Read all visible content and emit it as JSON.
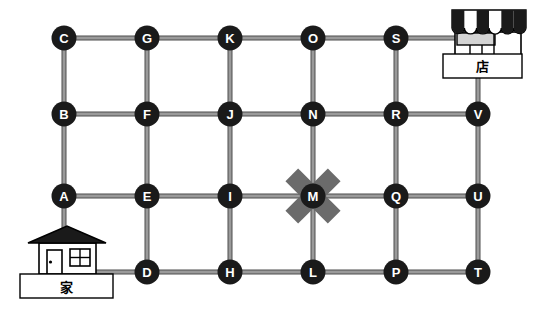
{
  "map": {
    "title": "Grid street map with home, shop and blocked intersection",
    "colors": {
      "node_fill": "#1a1a1a",
      "node_label": "#ffffff",
      "road": "#8c8c8c",
      "road_outline": "#4d4d4d",
      "blocked_mark": "#6b6b6b",
      "background": "#ffffff",
      "icon_stroke": "#000000"
    },
    "nodes": [
      {
        "id": "C",
        "label": "C",
        "x": 64,
        "y": 38,
        "row": 1,
        "col": 1
      },
      {
        "id": "G",
        "label": "G",
        "x": 147,
        "y": 38,
        "row": 1,
        "col": 2
      },
      {
        "id": "K",
        "label": "K",
        "x": 230,
        "y": 38,
        "row": 1,
        "col": 3
      },
      {
        "id": "O",
        "label": "O",
        "x": 313,
        "y": 38,
        "row": 1,
        "col": 4
      },
      {
        "id": "S",
        "label": "S",
        "x": 396,
        "y": 38,
        "row": 1,
        "col": 5
      },
      {
        "id": "B",
        "label": "B",
        "x": 64,
        "y": 114,
        "row": 2,
        "col": 1
      },
      {
        "id": "F",
        "label": "F",
        "x": 147,
        "y": 114,
        "row": 2,
        "col": 2
      },
      {
        "id": "J",
        "label": "J",
        "x": 230,
        "y": 114,
        "row": 2,
        "col": 3
      },
      {
        "id": "N",
        "label": "N",
        "x": 313,
        "y": 114,
        "row": 2,
        "col": 4
      },
      {
        "id": "R",
        "label": "R",
        "x": 396,
        "y": 114,
        "row": 2,
        "col": 5
      },
      {
        "id": "V",
        "label": "V",
        "x": 478,
        "y": 114,
        "row": 2,
        "col": 6
      },
      {
        "id": "A",
        "label": "A",
        "x": 64,
        "y": 196,
        "row": 3,
        "col": 1
      },
      {
        "id": "E",
        "label": "E",
        "x": 147,
        "y": 196,
        "row": 3,
        "col": 2
      },
      {
        "id": "I",
        "label": "I",
        "x": 230,
        "y": 196,
        "row": 3,
        "col": 3
      },
      {
        "id": "M",
        "label": "M",
        "x": 313,
        "y": 196,
        "row": 3,
        "col": 4
      },
      {
        "id": "Q",
        "label": "Q",
        "x": 396,
        "y": 196,
        "row": 3,
        "col": 5
      },
      {
        "id": "U",
        "label": "U",
        "x": 478,
        "y": 196,
        "row": 3,
        "col": 6
      },
      {
        "id": "D",
        "label": "D",
        "x": 147,
        "y": 272,
        "row": 4,
        "col": 2
      },
      {
        "id": "H",
        "label": "H",
        "x": 230,
        "y": 272,
        "row": 4,
        "col": 3
      },
      {
        "id": "L",
        "label": "L",
        "x": 313,
        "y": 272,
        "row": 4,
        "col": 4
      },
      {
        "id": "P",
        "label": "P",
        "x": 396,
        "y": 272,
        "row": 4,
        "col": 5
      },
      {
        "id": "T",
        "label": "T",
        "x": 478,
        "y": 272,
        "row": 4,
        "col": 6
      }
    ],
    "edges": [
      [
        "C",
        "G"
      ],
      [
        "G",
        "K"
      ],
      [
        "K",
        "O"
      ],
      [
        "O",
        "S"
      ],
      [
        "B",
        "F"
      ],
      [
        "F",
        "J"
      ],
      [
        "J",
        "N"
      ],
      [
        "N",
        "R"
      ],
      [
        "R",
        "V"
      ],
      [
        "A",
        "E"
      ],
      [
        "E",
        "I"
      ],
      [
        "I",
        "M"
      ],
      [
        "M",
        "Q"
      ],
      [
        "Q",
        "U"
      ],
      [
        "D",
        "H"
      ],
      [
        "H",
        "L"
      ],
      [
        "L",
        "P"
      ],
      [
        "P",
        "T"
      ],
      [
        "C",
        "B"
      ],
      [
        "B",
        "A"
      ],
      [
        "G",
        "F"
      ],
      [
        "F",
        "E"
      ],
      [
        "E",
        "D"
      ],
      [
        "K",
        "J"
      ],
      [
        "J",
        "I"
      ],
      [
        "I",
        "H"
      ],
      [
        "O",
        "N"
      ],
      [
        "N",
        "M"
      ],
      [
        "M",
        "L"
      ],
      [
        "S",
        "R"
      ],
      [
        "R",
        "Q"
      ],
      [
        "Q",
        "P"
      ],
      [
        "V",
        "U"
      ],
      [
        "U",
        "T"
      ]
    ],
    "blocked": {
      "node": "M",
      "marker": "x-cross",
      "description": "Intersection M is crossed out / closed"
    },
    "places": [
      {
        "id": "shop",
        "label": "店",
        "icon": "shop-icon",
        "x": 478,
        "y": 45,
        "connects_to": [
          "S",
          "V"
        ]
      },
      {
        "id": "home",
        "label": "家",
        "icon": "house-icon",
        "x": 64,
        "y": 262,
        "connects_to": [
          "A",
          "D"
        ]
      }
    ]
  }
}
